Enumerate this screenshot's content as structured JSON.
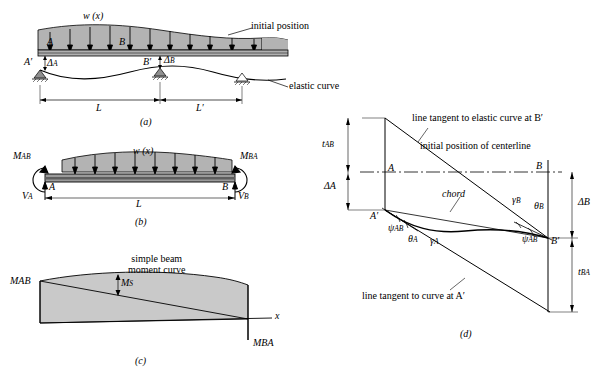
{
  "figure": {
    "panels": [
      {
        "id": "a",
        "caption": "(a)",
        "labels": {
          "load": "w (x)",
          "point_A": "A",
          "point_B": "B",
          "point_Ap": "A′",
          "point_Bp": "B′",
          "delta_A": "ΔA",
          "delta_B": "ΔB",
          "span_L": "L",
          "span_Lp": "L′",
          "initial_position": "initial position",
          "elastic_curve": "elastic curve"
        }
      },
      {
        "id": "b",
        "caption": "(b)",
        "labels": {
          "load": "w (x)",
          "M_AB": "MAB",
          "M_BA": "MBA",
          "V_A": "VA",
          "V_B": "VB",
          "point_A": "A",
          "point_B": "B",
          "span_L": "L"
        }
      },
      {
        "id": "c",
        "caption": "(c)",
        "labels": {
          "title_line1": "simple beam",
          "title_line2": "moment curve",
          "M_AB": "MAB",
          "M_BA": "MBA",
          "M_S": "MS",
          "axis_x": "x"
        }
      },
      {
        "id": "d",
        "caption": "(d)",
        "labels": {
          "tangent_Bp": "line tangent to elastic curve at B′",
          "initial_centerline": "initial position of centerline",
          "tangent_Ap": "line tangent to curve at A′",
          "chord": "chord",
          "t_AB": "tAB",
          "t_BA": "tBA",
          "delta_A": "ΔA",
          "delta_B": "ΔB",
          "point_A": "A",
          "point_B": "B",
          "point_Ap": "A′",
          "point_Bp": "B′",
          "psi_AB_top": "ψAB",
          "psi_AB_bottom": "ψAB",
          "theta_A": "θA",
          "gamma_A": "γA",
          "gamma_B": "γB",
          "theta_B": "θB"
        }
      }
    ],
    "colors": {
      "load_fill": "#b3b3b3",
      "beam_fill": "#9a9a9a",
      "beam_dark": "#6e6e6e",
      "moment_fill": "#c9c9c9",
      "support_fill": "#8f8f8f",
      "line": "#000000"
    }
  }
}
